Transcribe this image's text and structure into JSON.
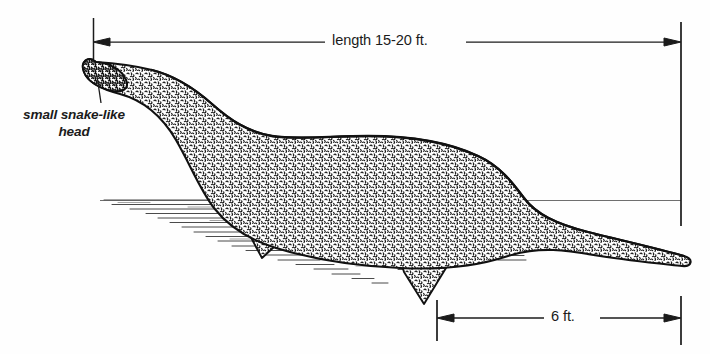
{
  "figure": {
    "background_color": "#fefefe",
    "ink_color": "#1b1b1b"
  },
  "annotations": {
    "length": {
      "text": "length 15-20 ft.",
      "name": "length-dimension-label"
    },
    "depth": {
      "text": "6 ft.",
      "name": "depth-dimension-label"
    },
    "head": {
      "line1": "small snake-like",
      "line2": "head",
      "name": "head-callout-label"
    }
  },
  "dimension_lines": {
    "length_line_y": 42,
    "length_line_x1": 93,
    "length_line_x2": 672,
    "depth_line_y": 318,
    "depth_line_x1": 437,
    "depth_line_x2": 681,
    "left_tick_x": 93,
    "right_tick_x": 681,
    "waterline_y": 201
  }
}
